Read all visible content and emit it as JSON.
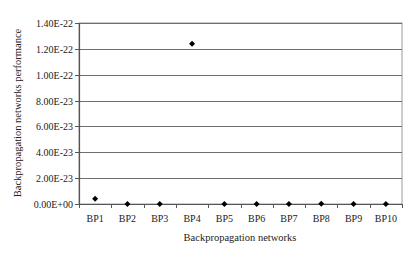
{
  "chart_data": {
    "type": "scatter",
    "title": "",
    "xlabel": "Backpropagation networks",
    "ylabel": "Backpropagation networks performance",
    "categories": [
      "BP1",
      "BP2",
      "BP3",
      "BP4",
      "BP5",
      "BP6",
      "BP7",
      "BP8",
      "BP9",
      "BP10"
    ],
    "values": [
      4e-24,
      0,
      0,
      1.24e-22,
      0,
      0,
      0,
      1e-25,
      0,
      0
    ],
    "ylim": [
      0,
      1.4e-22
    ],
    "yticks": [
      0,
      2e-23,
      4e-23,
      6e-23,
      8e-23,
      1e-22,
      1.2e-22,
      1.4e-22
    ],
    "ytick_labels": [
      "0.00E+00",
      "2.00E-23",
      "4.00E-23",
      "6.00E-23",
      "8.00E-23",
      "1.00E-22",
      "1.20E-22",
      "1.40E-22"
    ],
    "grid": true,
    "legend": null,
    "marker": "diamond",
    "colors": {
      "marker": "#000000",
      "grid": "#6e6e6e",
      "axis": "#555555",
      "border": "#9a9a9a"
    }
  }
}
